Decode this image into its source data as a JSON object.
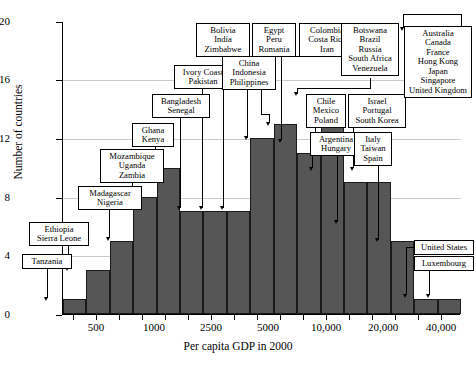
{
  "chart_data": {
    "type": "bar",
    "title": "",
    "xlabel": "Per capita GDP in 2000",
    "ylabel": "Number of countries",
    "ylim": [
      0,
      20
    ],
    "yticks": [
      0,
      4,
      8,
      12,
      16,
      20
    ],
    "xtick_labels": [
      "500",
      "1000",
      "2500",
      "5000",
      "10,000",
      "20,000",
      "40,000"
    ],
    "x_scale": "logarithmic",
    "grid": "horizontal gridlines at 4, 8, 12, 16",
    "legend": "none",
    "bin_count": 17,
    "categories": [
      "bin1",
      "bin2",
      "bin3",
      "bin4",
      "bin5",
      "bin6",
      "bin7",
      "bin8",
      "bin9",
      "bin10",
      "bin11",
      "bin12",
      "bin13",
      "bin14",
      "bin15",
      "bin16",
      "bin17"
    ],
    "values": [
      1,
      3,
      5,
      8,
      10,
      7,
      7,
      7,
      12,
      13,
      11,
      15,
      9,
      9,
      5,
      1,
      1
    ],
    "annotations": [
      {
        "label": "Tanzania",
        "bin": 1,
        "value": 1
      },
      {
        "label": "Ethiopia\nSierra Leone",
        "bin": 2,
        "value": 3
      },
      {
        "label": "Madagascar\nNigeria",
        "bin": 3,
        "value": 5
      },
      {
        "label": "Mozambique\nUganda\nZambia",
        "bin": 4,
        "value": 8
      },
      {
        "label": "Ghana\nKenya",
        "bin": 5,
        "value": 10
      },
      {
        "label": "Bangladesh\nSenegal",
        "bin": 6,
        "value": 7
      },
      {
        "label": "Ivory Coast\nPakistan",
        "bin": 7,
        "value": 7
      },
      {
        "label": "Bolivia\nIndia\nZimbabwe",
        "bin": 8,
        "value": 7
      },
      {
        "label": "China\nIndonesia\nPhilippines",
        "bin": 9,
        "value": 12
      },
      {
        "label": "Egypt\nPeru\nRomania",
        "bin": 10,
        "value": 13
      },
      {
        "label": "Colombia\nCosta Rica\nIran",
        "bin": 11,
        "value": 11
      },
      {
        "label": "Botswana\nBrazil\nRussia\nSouth Africa\nVenezuela",
        "bin": 12,
        "value": 15
      },
      {
        "label": "Chile\nMexico\nPoland",
        "bin": 13,
        "value": 9
      },
      {
        "label": "Argentina\nHungary",
        "bin": 13,
        "value": 9
      },
      {
        "label": "Israel\nPortugal\nSouth Korea",
        "bin": 14,
        "value": 9
      },
      {
        "label": "Italy\nTaiwan\nSpain",
        "bin": 15,
        "value": 5
      },
      {
        "label": "Australia\nCanada\nFrance\nHong Kong\nJapan\nSingapore\nUnited Kingdom",
        "bin": 16,
        "value": 19
      },
      {
        "label": "United States",
        "bin": 16,
        "value": 1
      },
      {
        "label": "Luxembourg",
        "bin": 17,
        "value": 1
      }
    ]
  },
  "axis": {
    "ylabel": "Number of countries",
    "xlabel": "Per capita GDP in 2000",
    "yticks": [
      "20",
      "16",
      "12",
      "8",
      "4",
      "0"
    ],
    "xticks": [
      "500",
      "1000",
      "2500",
      "5000",
      "10,000",
      "20,000",
      "40,000"
    ]
  },
  "callouts": {
    "tanzania": "Tanzania",
    "ethiopia_1": "Ethiopia",
    "ethiopia_2": "Sierra Leone",
    "madagascar_1": "Madagascar",
    "madagascar_2": "Nigeria",
    "mozambique_1": "Mozambique",
    "mozambique_2": "Uganda",
    "mozambique_3": "Zambia",
    "ghana_1": "Ghana",
    "ghana_2": "Kenya",
    "bangladesh_1": "Bangladesh",
    "bangladesh_2": "Senegal",
    "ivory_1": "Ivory Coast",
    "ivory_2": "Pakistan",
    "bolivia_1": "Bolivia",
    "bolivia_2": "India",
    "bolivia_3": "Zimbabwe",
    "china_1": "China",
    "china_2": "Indonesia",
    "china_3": "Philippines",
    "egypt_1": "Egypt",
    "egypt_2": "Peru",
    "egypt_3": "Romania",
    "colombia_1": "Colombia",
    "colombia_2": "Costa Rica",
    "colombia_3": "Iran",
    "botswana_1": "Botswana",
    "botswana_2": "Brazil",
    "botswana_3": "Russia",
    "botswana_4": "South Africa",
    "botswana_5": "Venezuela",
    "chile_1": "Chile",
    "chile_2": "Mexico",
    "chile_3": "Poland",
    "argentina_1": "Argentina",
    "argentina_2": "Hungary",
    "israel_1": "Israel",
    "israel_2": "Portugal",
    "israel_3": "South Korea",
    "italy_1": "Italy",
    "italy_2": "Taiwan",
    "italy_3": "Spain",
    "rich_1": "Australia",
    "rich_2": "Canada",
    "rich_3": "France",
    "rich_4": "Hong Kong",
    "rich_5": "Japan",
    "rich_6": "Singapore",
    "rich_7": "United Kingdom",
    "usa": "United States",
    "luxembourg": "Luxembourg"
  }
}
